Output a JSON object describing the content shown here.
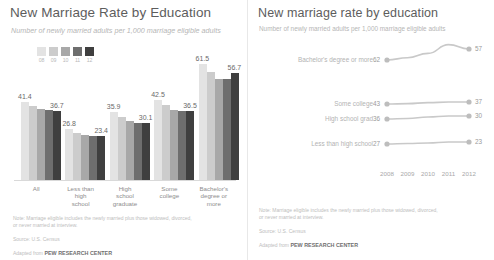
{
  "left_panel": {
    "title": "New Marriage Rate by Education",
    "subtitle": "Number of newly married adults per 1,000 marriage eligible adults",
    "legend": {
      "years": [
        "08",
        "09",
        "10",
        "11",
        "12"
      ],
      "colors": [
        "#e3e3e3",
        "#cccccc",
        "#a8a8a8",
        "#6e6e6e",
        "#3f3f3f"
      ]
    },
    "notes": {
      "note": "Note: Marriage eligible includes the newly married plus those widowed, divorced,\nor never married at interview.",
      "source": "Source: U.S. Census",
      "adapted_prefix": "Adapted from ",
      "adapted_brand": "PEW RESEARCH CENTER"
    }
  },
  "right_panel": {
    "title": "New marriage rate by education",
    "subtitle": "Number of newly married adults per 1,000 marriage eligible adults",
    "notes": {
      "note": "Note: Marriage eligible includes the newly married plus those widowed, divorced,\nor never married at interview.",
      "source": "Source: U.S. Census",
      "adapted_prefix": "Adapted from ",
      "adapted_brand": "PEW RESEARCH CENTER"
    }
  },
  "chart_data": [
    {
      "type": "bar",
      "title": "New Marriage Rate by Education",
      "subtitle": "Number of newly married adults per 1,000 marriage eligible adults",
      "xlabel": "",
      "ylabel": "Newly married adults per 1,000 marriage eligible adults",
      "ylim": [
        0,
        70
      ],
      "grid": false,
      "legend_position": "top-left",
      "categories": [
        "All",
        "Less than high school",
        "High school graduate",
        "Some college",
        "Bachelor's degree or more"
      ],
      "category_lines": [
        [
          "All"
        ],
        [
          "Less than",
          "high",
          "school"
        ],
        [
          "High",
          "school",
          "graduate"
        ],
        [
          "Some",
          "college"
        ],
        [
          "Bachelor's",
          "degree or",
          "more"
        ]
      ],
      "series": [
        {
          "name": "08",
          "color": "#e3e3e3",
          "values": [
            41.4,
            26.8,
            35.9,
            42.5,
            61.5
          ]
        },
        {
          "name": "09",
          "color": "#cccccc",
          "values": [
            39.2,
            25.0,
            33.4,
            40.0,
            57.4
          ]
        },
        {
          "name": "10",
          "color": "#a8a8a8",
          "values": [
            37.6,
            24.0,
            31.2,
            37.2,
            53.8
          ]
        },
        {
          "name": "11",
          "color": "#6e6e6e",
          "values": [
            37.0,
            23.3,
            30.4,
            36.6,
            53.6
          ]
        },
        {
          "name": "12",
          "color": "#3f3f3f",
          "values": [
            36.7,
            23.4,
            30.1,
            36.5,
            56.7
          ]
        }
      ],
      "value_labels": [
        {
          "text": "41.4",
          "group": "All",
          "series": "08"
        },
        {
          "text": "36.7",
          "group": "All",
          "series": "12"
        },
        {
          "text": "26.8",
          "group": "Less than high school",
          "series": "08"
        },
        {
          "text": "23.4",
          "group": "Less than high school",
          "series": "12"
        },
        {
          "text": "35.9",
          "group": "High school graduate",
          "series": "08"
        },
        {
          "text": "30.1",
          "group": "High school graduate",
          "series": "12"
        },
        {
          "text": "42.5",
          "group": "Some college",
          "series": "08"
        },
        {
          "text": "36.5",
          "group": "Some college",
          "series": "12"
        },
        {
          "text": "61.5",
          "group": "Bachelor's degree or more",
          "series": "08"
        },
        {
          "text": "56.7",
          "group": "Bachelor's degree or more",
          "series": "12"
        }
      ]
    },
    {
      "type": "line",
      "title": "New marriage rate by education",
      "subtitle": "Number of newly married adults per 1,000 marriage eligible adults",
      "xlabel": "",
      "ylabel": "",
      "x": [
        "2008",
        "2009",
        "2010",
        "2011",
        "2012"
      ],
      "ylim": [
        0,
        70
      ],
      "grid": false,
      "legend_position": "left-labels",
      "line_color": "#c9c9c9",
      "series": [
        {
          "name": "Bachelor's degree or more",
          "start_label": "62",
          "end_label": "57",
          "values": [
            62,
            61,
            59,
            55,
            57
          ]
        },
        {
          "name": "Some college",
          "start_label": "43",
          "end_label": "37",
          "values": [
            43,
            42,
            39,
            37,
            37
          ]
        },
        {
          "name": "High school grad",
          "start_label": "36",
          "end_label": "30",
          "values": [
            36,
            35,
            32,
            30,
            30
          ]
        },
        {
          "name": "Less than high school",
          "start_label": "27",
          "end_label": "23",
          "values": [
            27,
            26,
            25,
            23,
            23
          ]
        }
      ]
    }
  ]
}
